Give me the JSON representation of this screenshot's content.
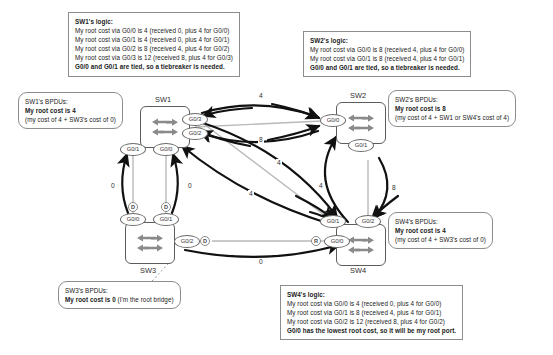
{
  "diagram": {
    "colors": {
      "link": "#b3b3b3",
      "arrow": "#1a1a1a",
      "device_border": "#5c5c5c",
      "note_border": "#8d8d8d",
      "text": "#1a1a1a"
    }
  },
  "notes": [
    {
      "id": "sw1-logic",
      "heading": "SW1's logic:",
      "lines": [
        "My root cost via G0/0 is 4 (received 0, plus 4 for G0/0)",
        "My root cost via G0/1 is 4 (received 0, plus 4 for G0/1)",
        "My root cost via G0/2 is 8 (received 4, plus 4 for G0/2)",
        "My root cost via G0/3 is 12 (received 8, plus 4 for G0/3)"
      ],
      "bold_last": "G0/0 and G0/1 are tied, so a tiebreaker is needed."
    },
    {
      "id": "sw2-logic",
      "heading": "SW2's logic:",
      "lines": [
        "My root cost via G0/0 is 8 (received 4, plus 4 for G0/0)",
        "My root cost via G0/1 is 8 (received 4, plus 4 for G0/1)"
      ],
      "bold_last": "G0/0 and G0/1 are tied, so a tiebreaker is needed."
    },
    {
      "id": "sw4-logic",
      "heading": "SW4's logic:",
      "lines": [
        "My root cost via G0/0 is 4 (received 0, plus 4 for G0/0)",
        "My root cost via G0/1 is 8 (received 4, plus 4 for G0/1)",
        "My root cost via G0/2 is 12 (received 8, plus 4 for G0/2)"
      ],
      "bold_last": "G0/0 has the lowest root cost, so it will be my root port."
    }
  ],
  "bpdus": [
    {
      "id": "sw1-bpdus",
      "heading": "SW1's BPDUs:",
      "bold": "My root cost is 4",
      "paren": "(my cost of 4 + SW3's cost of 0)"
    },
    {
      "id": "sw2-bpdus",
      "heading": "SW2's BPDUs:",
      "bold": "My root cost is 8",
      "paren": "(my cost of 4 + SW1 or SW4's cost of 4)"
    },
    {
      "id": "sw4-bpdus",
      "heading": "SW4's BPDUs:",
      "bold": "My root cost is 4",
      "paren": "(my cost of 4 + SW3's cost of 0)"
    },
    {
      "id": "sw3-bpdus",
      "heading": "SW3's BPDUs:",
      "bold": "My root cost is 0",
      "paren": "(I'm the root bridge)"
    }
  ],
  "switches": [
    {
      "id": "sw1",
      "label": "SW1"
    },
    {
      "id": "sw2",
      "label": "SW2"
    },
    {
      "id": "sw3",
      "label": "SW3"
    },
    {
      "id": "sw4",
      "label": "SW4"
    }
  ],
  "ports": {
    "sw1": [
      {
        "name": "G0/3",
        "role": ""
      },
      {
        "name": "G0/2",
        "role": ""
      },
      {
        "name": "G0/1",
        "role": ""
      },
      {
        "name": "G0/0",
        "role": ""
      }
    ],
    "sw2": [
      {
        "name": "G0/0",
        "role": ""
      },
      {
        "name": "G0/1",
        "role": ""
      }
    ],
    "sw3": [
      {
        "name": "G0/0",
        "role": "D"
      },
      {
        "name": "G0/1",
        "role": "D"
      },
      {
        "name": "G0/2",
        "role": "D"
      }
    ],
    "sw4": [
      {
        "name": "G0/1",
        "role": ""
      },
      {
        "name": "G0/2",
        "role": ""
      },
      {
        "name": "G0/0",
        "role": "R"
      }
    ]
  },
  "costs": [
    {
      "id": "sw1-sw2-top",
      "value": "4"
    },
    {
      "id": "sw1-sw2-bottom",
      "value": "8"
    },
    {
      "id": "sw1-sw3-left",
      "value": "0"
    },
    {
      "id": "sw1-sw3-right",
      "value": "0"
    },
    {
      "id": "sw1-sw4-upper",
      "value": "4"
    },
    {
      "id": "sw1-sw4-lower",
      "value": "4"
    },
    {
      "id": "sw2-sw4-left",
      "value": "4"
    },
    {
      "id": "sw2-sw4-right",
      "value": "8"
    },
    {
      "id": "sw3-sw4",
      "value": "0"
    }
  ]
}
